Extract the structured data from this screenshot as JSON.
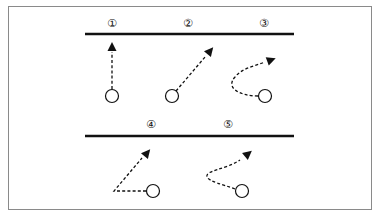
{
  "diagram": {
    "lines": [
      {
        "id": "top-line",
        "x1": 85,
        "x2": 294,
        "y": 34
      },
      {
        "id": "bottom-line",
        "x1": 85,
        "x2": 294,
        "y": 136
      }
    ],
    "items": [
      {
        "label": "①",
        "lx": 112,
        "ly": 23,
        "cx": 112,
        "cy": 96,
        "path": "M112,89 L112,52",
        "arrow": {
          "x": 112,
          "y": 47,
          "angle": -90
        }
      },
      {
        "label": "②",
        "lx": 188,
        "ly": 23,
        "cx": 172,
        "cy": 96,
        "path": "M176,91 L205,57",
        "arrow": {
          "x": 210,
          "y": 51,
          "angle": -50
        }
      },
      {
        "label": "③",
        "lx": 264,
        "ly": 23,
        "cx": 265,
        "cy": 96,
        "path": "M258,96 C240,96 225,88 235,77 C242,68 255,66 265,62",
        "arrow": {
          "x": 271,
          "y": 60,
          "angle": -20
        }
      },
      {
        "label": "④",
        "lx": 151,
        "ly": 124,
        "cx": 153,
        "cy": 191,
        "path": "M146,191 L114,191 L142,158",
        "arrow": {
          "x": 147,
          "y": 153,
          "angle": -50
        }
      },
      {
        "label": "⑤",
        "lx": 228,
        "ly": 124,
        "cx": 242,
        "cy": 191,
        "path": "M235,189 C222,184 210,182 207,177 C205,170 225,170 240,160",
        "arrow": {
          "x": 248,
          "y": 154,
          "angle": -40
        }
      }
    ],
    "colors": {
      "stroke": "#111111",
      "frame": "#8a8a8a"
    }
  }
}
